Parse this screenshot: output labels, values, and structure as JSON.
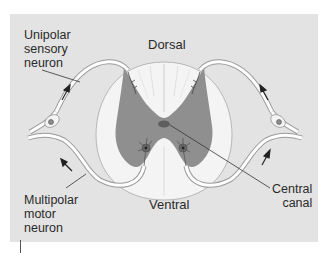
{
  "figure": {
    "labels": {
      "dorsal": "Dorsal",
      "ventral": "Ventral",
      "sensory_line1": "Unipolar",
      "sensory_line2": "sensory",
      "sensory_line3": "neuron",
      "motor_line1": "Multipolar",
      "motor_line2": "motor",
      "motor_line3": "neuron",
      "canal_line1": "Central",
      "canal_line2": "canal"
    },
    "colors": {
      "background": "#e3e3e3",
      "white_matter": "#f4f4f4",
      "gray_matter": "#8f8f8f",
      "neuron_body": "#6e6e6e",
      "outline": "#9a9a9a",
      "text": "#2a2a2a"
    }
  }
}
